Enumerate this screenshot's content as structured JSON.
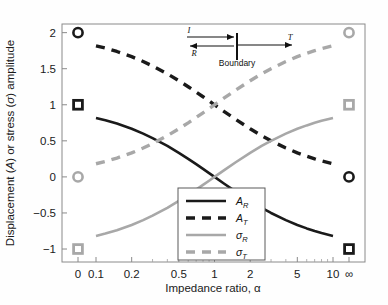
{
  "chart_data": {
    "type": "line",
    "title": "",
    "xlabel": "Impedance ratio, α",
    "ylabel": "Displacement (A) or stress (σ) amplitude",
    "x_scale": "log",
    "x_tick_labels": [
      "0",
      "0.1",
      "0.2",
      "0.5",
      "1",
      "2",
      "5",
      "10",
      "∞"
    ],
    "x_tick_values": [
      0,
      0.1,
      0.2,
      0.5,
      1,
      2,
      5,
      10,
      null
    ],
    "y_tick_labels": [
      "2",
      "1.5",
      "1",
      "0.5",
      "0",
      "−0.5",
      "−1"
    ],
    "y_tick_values": [
      2,
      1.5,
      1,
      0.5,
      0,
      -0.5,
      -1
    ],
    "ylim": [
      -1.18,
      2.12
    ],
    "xlim_log": [
      0.1,
      10
    ],
    "grid": false,
    "legend_position": "bottom-center",
    "series": [
      {
        "name": "A_R",
        "label": "A",
        "subscript": "R",
        "style": "solid",
        "color": "#1a1a1a",
        "formula": "(1-alpha)/(1+alpha)",
        "x": [
          0.1,
          0.12,
          0.15,
          0.2,
          0.25,
          0.3,
          0.4,
          0.5,
          0.6,
          0.7,
          0.8,
          0.9,
          1.0,
          1.2,
          1.5,
          2.0,
          2.5,
          3.0,
          4.0,
          5.0,
          6.0,
          7.0,
          8.0,
          10.0
        ],
        "y": [
          0.818,
          0.786,
          0.739,
          0.667,
          0.6,
          0.538,
          0.429,
          0.333,
          0.25,
          0.176,
          0.111,
          0.053,
          0.0,
          -0.091,
          -0.2,
          -0.333,
          -0.429,
          -0.5,
          -0.6,
          -0.667,
          -0.714,
          -0.75,
          -0.778,
          -0.818
        ]
      },
      {
        "name": "A_T",
        "label": "A",
        "subscript": "T",
        "style": "dashed",
        "color": "#1a1a1a",
        "formula": "2/(1+alpha)",
        "x": [
          0.1,
          0.12,
          0.15,
          0.2,
          0.25,
          0.3,
          0.4,
          0.5,
          0.6,
          0.7,
          0.8,
          0.9,
          1.0,
          1.2,
          1.5,
          2.0,
          2.5,
          3.0,
          4.0,
          5.0,
          6.0,
          7.0,
          8.0,
          10.0
        ],
        "y": [
          1.818,
          1.786,
          1.739,
          1.667,
          1.6,
          1.538,
          1.429,
          1.333,
          1.25,
          1.176,
          1.111,
          1.053,
          1.0,
          0.909,
          0.8,
          0.667,
          0.571,
          0.5,
          0.4,
          0.333,
          0.286,
          0.25,
          0.222,
          0.182
        ]
      },
      {
        "name": "sigma_R",
        "label": "σ",
        "subscript": "R",
        "style": "solid",
        "color": "#a8a8a8",
        "formula": "(alpha-1)/(alpha+1)",
        "x": [
          0.1,
          0.12,
          0.15,
          0.2,
          0.25,
          0.3,
          0.4,
          0.5,
          0.6,
          0.7,
          0.8,
          0.9,
          1.0,
          1.2,
          1.5,
          2.0,
          2.5,
          3.0,
          4.0,
          5.0,
          6.0,
          7.0,
          8.0,
          10.0
        ],
        "y": [
          -0.818,
          -0.786,
          -0.739,
          -0.667,
          -0.6,
          -0.538,
          -0.429,
          -0.333,
          -0.25,
          -0.176,
          -0.111,
          -0.053,
          0.0,
          0.091,
          0.2,
          0.333,
          0.429,
          0.5,
          0.6,
          0.667,
          0.714,
          0.75,
          0.778,
          0.818
        ]
      },
      {
        "name": "sigma_T",
        "label": "σ",
        "subscript": "T",
        "style": "dashed",
        "color": "#a8a8a8",
        "formula": "2*alpha/(1+alpha)",
        "x": [
          0.1,
          0.12,
          0.15,
          0.2,
          0.25,
          0.3,
          0.4,
          0.5,
          0.6,
          0.7,
          0.8,
          0.9,
          1.0,
          1.2,
          1.5,
          2.0,
          2.5,
          3.0,
          4.0,
          5.0,
          6.0,
          7.0,
          8.0,
          10.0
        ],
        "y": [
          0.182,
          0.214,
          0.261,
          0.333,
          0.4,
          0.462,
          0.571,
          0.667,
          0.75,
          0.824,
          0.889,
          0.947,
          1.0,
          1.091,
          1.2,
          1.333,
          1.429,
          1.5,
          1.6,
          1.667,
          1.714,
          1.75,
          1.778,
          1.818
        ]
      }
    ],
    "endpoint_markers": [
      {
        "name": "A_R at alpha=0",
        "x_pos": "zero",
        "y": 2,
        "shape": "circle",
        "color": "#1a1a1a",
        "filled": false
      },
      {
        "name": "A_T at alpha=0",
        "x_pos": "zero",
        "y": 1,
        "shape": "square",
        "color": "#1a1a1a",
        "filled": false
      },
      {
        "name": "sigma_T at alpha=0",
        "x_pos": "zero",
        "y": 0,
        "shape": "circle",
        "color": "#a8a8a8",
        "filled": false
      },
      {
        "name": "sigma_R at alpha=0",
        "x_pos": "zero",
        "y": -1,
        "shape": "square",
        "color": "#a8a8a8",
        "filled": false
      },
      {
        "name": "sigma_T at alpha=inf",
        "x_pos": "inf",
        "y": 2,
        "shape": "circle",
        "color": "#a8a8a8",
        "filled": false
      },
      {
        "name": "sigma_R at alpha=inf",
        "x_pos": "inf",
        "y": 1,
        "shape": "square",
        "color": "#a8a8a8",
        "filled": false
      },
      {
        "name": "A_T at alpha=inf",
        "x_pos": "inf",
        "y": 0,
        "shape": "circle",
        "color": "#1a1a1a",
        "filled": false
      },
      {
        "name": "A_R at alpha=inf",
        "x_pos": "inf",
        "y": -1,
        "shape": "square",
        "color": "#1a1a1a",
        "filled": false
      }
    ]
  },
  "legend": {
    "entries": [
      {
        "label": "A",
        "subscript": "R",
        "style": "solid",
        "color": "#1a1a1a"
      },
      {
        "label": "A",
        "subscript": "T",
        "style": "dashed",
        "color": "#1a1a1a"
      },
      {
        "label": "σ",
        "subscript": "R",
        "style": "solid",
        "color": "#a8a8a8"
      },
      {
        "label": "σ",
        "subscript": "T",
        "style": "dashed",
        "color": "#a8a8a8"
      }
    ]
  },
  "inset": {
    "incident_label": "I",
    "reflected_label": "R",
    "transmitted_label": "T",
    "boundary_label": "Boundary"
  },
  "axes": {
    "x_title": "Impedance ratio, α",
    "y_title_part1": "Displacement (",
    "y_title_italic1": "A",
    "y_title_part2": ") or stress (",
    "y_title_italic2": "σ",
    "y_title_part3": ") amplitude"
  }
}
